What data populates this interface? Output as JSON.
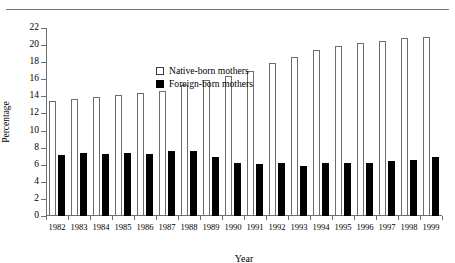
{
  "figure": {
    "clipped_caption": "",
    "top_rule": true
  },
  "legend": {
    "position": "inside-top-left",
    "entries": [
      {
        "label": "Native-born mothers",
        "swatch": "open-square",
        "color": "#ffffff"
      },
      {
        "label": "Foreign-born mothers",
        "swatch": "filled-square",
        "color": "#000000"
      }
    ]
  },
  "chart_data": {
    "type": "bar",
    "title": "",
    "xlabel": "Year",
    "ylabel": "Percentage",
    "ylim": [
      0,
      22
    ],
    "yticks": [
      0,
      2,
      4,
      6,
      8,
      10,
      12,
      14,
      16,
      18,
      20,
      22
    ],
    "grid": false,
    "categories": [
      "1982",
      "1983",
      "1984",
      "1985",
      "1986",
      "1987",
      "1988",
      "1989",
      "1990",
      "1991",
      "1992",
      "1993",
      "1994",
      "1995",
      "1996",
      "1997",
      "1998",
      "1999"
    ],
    "series": [
      {
        "name": "Native-born mothers",
        "color": "#ffffff",
        "edge_color": "#6d6d6d",
        "values": [
          13.5,
          13.7,
          13.9,
          14.2,
          14.4,
          14.6,
          15.3,
          15.9,
          16.4,
          17.0,
          17.9,
          18.6,
          19.4,
          19.9,
          20.2,
          20.5,
          20.8,
          21.0
        ]
      },
      {
        "name": "Foreign-born mothers",
        "color": "#000000",
        "edge_color": "#000000",
        "values": [
          7.1,
          7.4,
          7.3,
          7.4,
          7.3,
          7.6,
          7.6,
          6.9,
          6.2,
          6.1,
          6.2,
          5.9,
          6.2,
          6.2,
          6.2,
          6.4,
          6.6,
          6.9
        ]
      }
    ]
  },
  "axes": {
    "y_tick_labels": [
      "0",
      "2",
      "4",
      "6",
      "8",
      "10",
      "12",
      "14",
      "16",
      "18",
      "20",
      "22"
    ],
    "x_tick_labels": [
      "1982",
      "1983",
      "1984",
      "1985",
      "1986",
      "1987",
      "1988",
      "1989",
      "1990",
      "1991",
      "1992",
      "1993",
      "1994",
      "1995",
      "1996",
      "1997",
      "1998",
      "1999"
    ]
  }
}
